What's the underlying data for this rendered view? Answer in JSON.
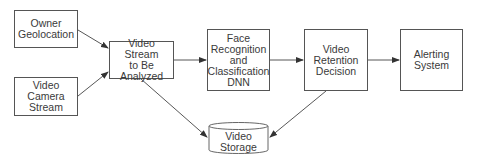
{
  "diagram": {
    "nodes": [
      {
        "id": "owner-geolocation",
        "label": "Owner\nGeolocation"
      },
      {
        "id": "video-camera-stream",
        "label": "Video\nCamera\nStream"
      },
      {
        "id": "video-stream-to-be-analyzed",
        "label": "Video Stream\nto Be\nAnalyzed"
      },
      {
        "id": "face-recognition-dnn",
        "label": "Face\nRecognition\nand\nClassification\nDNN"
      },
      {
        "id": "video-retention-decision",
        "label": "Video\nRetention\nDecision"
      },
      {
        "id": "alerting-system",
        "label": "Alerting\nSystem"
      },
      {
        "id": "video-storage",
        "label": "Video\nStorage",
        "shape": "cylinder"
      }
    ],
    "edges": [
      {
        "from": "owner-geolocation",
        "to": "video-stream-to-be-analyzed"
      },
      {
        "from": "video-camera-stream",
        "to": "video-stream-to-be-analyzed"
      },
      {
        "from": "video-stream-to-be-analyzed",
        "to": "face-recognition-dnn"
      },
      {
        "from": "face-recognition-dnn",
        "to": "video-retention-decision"
      },
      {
        "from": "video-retention-decision",
        "to": "alerting-system"
      },
      {
        "from": "video-stream-to-be-analyzed",
        "to": "video-storage"
      },
      {
        "from": "video-retention-decision",
        "to": "video-storage"
      }
    ]
  }
}
